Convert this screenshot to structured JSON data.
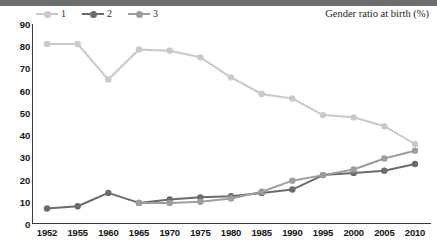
{
  "chart_data": {
    "type": "line",
    "title": "Gender ratio at birth (%)",
    "xlabel": "",
    "ylabel": "",
    "ylim": [
      0,
      90
    ],
    "ytick_step": 10,
    "yticks": [
      90,
      80,
      70,
      60,
      50,
      40,
      30,
      20,
      10,
      0
    ],
    "grid": false,
    "legend_position": "top-left",
    "categories": [
      1952,
      1955,
      1960,
      1965,
      1970,
      1975,
      1980,
      1985,
      1990,
      1995,
      2000,
      2005,
      2010
    ],
    "series": [
      {
        "name": "1",
        "color": "#c9c9c9",
        "values": [
          81,
          81,
          65,
          78.5,
          78,
          75,
          66,
          58.5,
          56.5,
          49,
          48,
          44,
          36
        ]
      },
      {
        "name": "2",
        "color": "#6b6b6b",
        "values": [
          7,
          8,
          14,
          9.5,
          11,
          12,
          12.5,
          14,
          15.5,
          22,
          23,
          24,
          27
        ]
      },
      {
        "name": "3",
        "color": "#9d9d9d",
        "values": [
          null,
          null,
          null,
          9.5,
          9.5,
          10,
          11.5,
          14.5,
          19.5,
          22,
          24.5,
          29.5,
          33
        ]
      }
    ]
  },
  "legend": {
    "entries": [
      {
        "label": "1"
      },
      {
        "label": "2"
      },
      {
        "label": "3"
      }
    ]
  },
  "axes": {
    "y_tick_labels": [
      "90",
      "80",
      "70",
      "60",
      "50",
      "40",
      "30",
      "20",
      "10",
      "0"
    ],
    "x_tick_labels": [
      "1952",
      "1955",
      "1960",
      "1965",
      "1970",
      "1975",
      "1980",
      "1985",
      "1990",
      "1995",
      "2000",
      "2005",
      "2010"
    ]
  },
  "colors": {
    "top_band": "#6e6e6e",
    "axis": "#3a3a3a",
    "series_1": "#c9c9c9",
    "series_2": "#6b6b6b",
    "series_3": "#9d9d9d",
    "text": "#151515"
  }
}
